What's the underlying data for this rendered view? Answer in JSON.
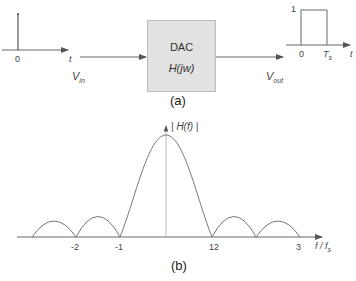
{
  "panel_a": {
    "caption": "(a)",
    "input_signal": {
      "origin": "0",
      "axis": "t",
      "label": "V",
      "label_sub": "in"
    },
    "block": {
      "title": "DAC",
      "transfer": "H(jw)"
    },
    "output_signal": {
      "height_label": "1",
      "origin": "0",
      "width_label": "T",
      "width_sub": "s",
      "axis": "t",
      "label": "V",
      "label_sub": "out"
    }
  },
  "panel_b": {
    "caption": "(b)",
    "y_label": "| H(f) |",
    "x_label": "f / f",
    "x_label_sub": "s",
    "ticks": [
      "-2",
      "-1",
      "12",
      "3"
    ]
  },
  "colors": {
    "line": "#555555",
    "block_fill": "#e2e2e2",
    "block_border": "#bdbdbd"
  }
}
